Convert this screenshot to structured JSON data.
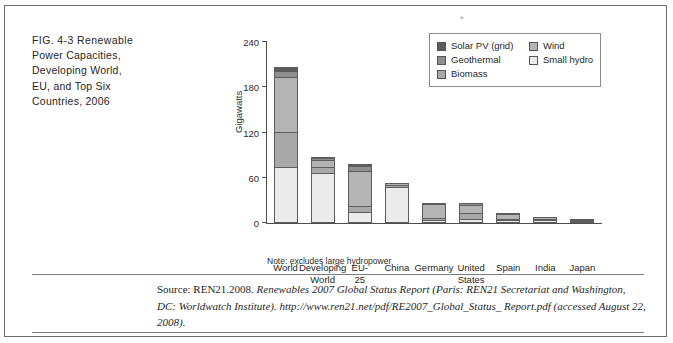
{
  "figure": {
    "number": "FIG. 4-3",
    "caption": "Renewable Power Capacities, Developing World, EU, and Top Six Countries, 2006",
    "caption_lines": [
      "FIG. 4-3   Renewable",
      "Power Capacities,",
      "Developing World,",
      "EU, and Top Six",
      "Countries, 2006"
    ],
    "top_mark": "*",
    "note": "Note: excludes large hydropower"
  },
  "source": {
    "label": "Source:",
    "line1_plain": " REN21.2008. ",
    "line1_italic": "Renewables 2007 Global Status Report (Paris: REN21 Secretariat and",
    "line2_italic": "Washington, DC: Worldwatch Institute). http://www.ren21.net/pdf/RE2007_Global_Status_",
    "line3_italic": "Report.pdf (accessed August 22, 2008)."
  },
  "legend": {
    "entries": [
      {
        "label": "Solar PV (grid)",
        "color": "#5c5c5c"
      },
      {
        "label": "Wind",
        "color": "#b4b4b4"
      },
      {
        "label": "Geothermal",
        "color": "#8f8f8f"
      },
      {
        "label": "Small hydro",
        "color": "#ebebeb"
      },
      {
        "label": "Biomass",
        "color": "#a8a8a8"
      }
    ]
  },
  "chart_data": {
    "type": "bar",
    "subtype": "stacked",
    "title": "Renewable Power Capacities, Developing World, EU, and Top Six Countries, 2006",
    "xlabel": "",
    "ylabel": "Gigawatts",
    "ylim": [
      0,
      240
    ],
    "yticks": [
      0,
      60,
      120,
      180,
      240
    ],
    "grid": false,
    "legend_position": "top-right",
    "note": "Note: excludes large hydropower",
    "categories": [
      "World",
      "Developing World",
      "EU-25",
      "China",
      "Germany",
      "United States",
      "Spain",
      "India",
      "Japan"
    ],
    "category_lines": [
      [
        "World"
      ],
      [
        "Developing",
        "World"
      ],
      [
        "EU-",
        "25"
      ],
      [
        "China"
      ],
      [
        "Germany"
      ],
      [
        "United",
        "States"
      ],
      [
        "Spain"
      ],
      [
        "India"
      ],
      [
        "Japan"
      ]
    ],
    "series": [
      {
        "name": "Small hydro",
        "color": "#ebebeb",
        "values": [
          73,
          65,
          12,
          47,
          2,
          3,
          2,
          2,
          1
        ]
      },
      {
        "name": "Biomass",
        "color": "#a8a8a8",
        "values": [
          46,
          9,
          8,
          3,
          2,
          9,
          1,
          2,
          2
        ]
      },
      {
        "name": "Wind",
        "color": "#b4b4b4",
        "values": [
          74,
          9,
          49,
          3,
          21,
          12,
          9,
          4,
          1
        ]
      },
      {
        "name": "Geothermal",
        "color": "#8f8f8f",
        "values": [
          8,
          3,
          6,
          0,
          0,
          3,
          0,
          0,
          1
        ]
      },
      {
        "name": "Solar PV (grid)",
        "color": "#5c5c5c",
        "values": [
          6,
          2,
          3,
          0,
          2,
          0,
          1,
          0,
          0
        ]
      }
    ],
    "totals": [
      207,
      88,
      78,
      53,
      27,
      27,
      13,
      8,
      5
    ]
  }
}
